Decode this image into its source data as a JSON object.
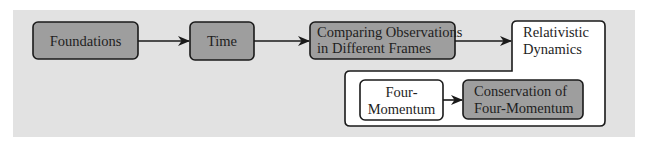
{
  "colors": {
    "panel": "#e2e2e2",
    "shaded_box": "#9e9e9e",
    "white_box": "#ffffff",
    "stroke": "#1a1a1a"
  },
  "nodes": {
    "foundations": {
      "label": "Foundations",
      "style": "shaded"
    },
    "time": {
      "label": "Time",
      "style": "shaded"
    },
    "comparing": {
      "line1": "Comparing Observations",
      "line2": "in Different Frames",
      "style": "shaded"
    },
    "relativistic": {
      "line1": "Relativistic",
      "line2": "Dynamics",
      "style": "white-container"
    },
    "four_momentum": {
      "line1": "Four-",
      "line2": "Momentum",
      "style": "white"
    },
    "conservation": {
      "line1": "Conservation of",
      "line2": "Four-Momentum",
      "style": "shaded"
    }
  },
  "edges": [
    {
      "from": "Foundations",
      "to": "Time"
    },
    {
      "from": "Time",
      "to": "Comparing Observations in Different Frames"
    },
    {
      "from": "Comparing Observations in Different Frames",
      "to": "Relativistic Dynamics"
    },
    {
      "from": "Four-Momentum",
      "to": "Conservation of Four-Momentum"
    }
  ]
}
